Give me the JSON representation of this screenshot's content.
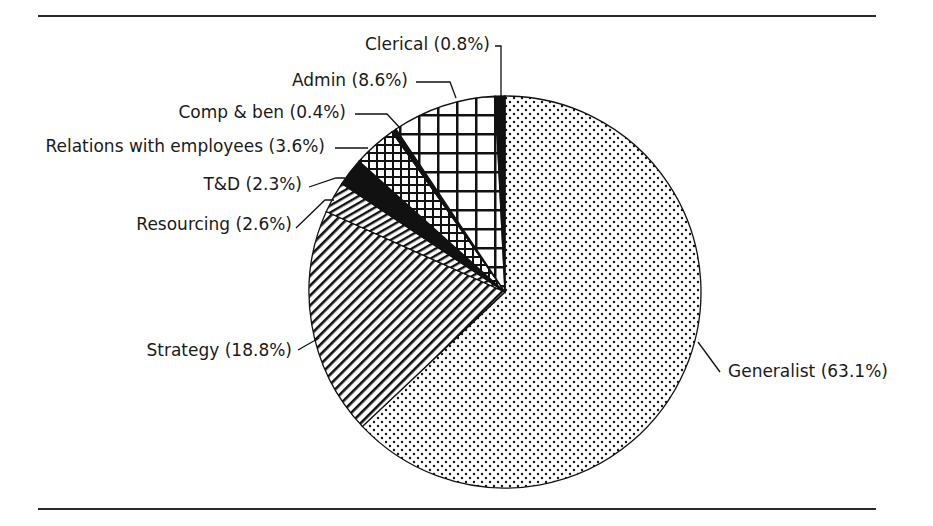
{
  "chart_data": {
    "type": "pie",
    "title": "",
    "start_angle_deg": 0,
    "direction": "clockwise",
    "slices": [
      {
        "label": "Generalist",
        "value": 63.1,
        "display": "Generalist (63.1%)",
        "pattern": "dots"
      },
      {
        "label": "Strategy",
        "value": 18.8,
        "display": "Strategy (18.8%)",
        "pattern": "diagonal-wide"
      },
      {
        "label": "Resourcing",
        "value": 2.6,
        "display": "Resourcing (2.6%)",
        "pattern": "diagonal-shallow"
      },
      {
        "label": "T&D",
        "value": 2.3,
        "display": "T&D (2.3%)",
        "pattern": "solid-black"
      },
      {
        "label": "Relations with employees",
        "value": 3.6,
        "display": "Relations with employees (3.6%)",
        "pattern": "crosshatch-small"
      },
      {
        "label": "Comp & ben",
        "value": 0.4,
        "display": "Comp & ben (0.4%)",
        "pattern": "solid-black"
      },
      {
        "label": "Admin",
        "value": 8.6,
        "display": "Admin (8.6%)",
        "pattern": "grid-large"
      },
      {
        "label": "Clerical",
        "value": 0.8,
        "display": "Clerical (0.8%)",
        "pattern": "solid-black"
      }
    ],
    "legend": "none (leader-line labels)"
  },
  "geometry": {
    "cx": 505,
    "cy": 292,
    "r": 196
  },
  "labels": [
    {
      "key": "chart_data.slices.0.display",
      "x": 728,
      "y": 377,
      "anchor": "start",
      "line": [
        [
          698,
          342
        ],
        [
          720,
          372
        ]
      ]
    },
    {
      "key": "chart_data.slices.1.display",
      "x": 292,
      "y": 356,
      "anchor": "end",
      "line": [
        [
          298,
          350
        ],
        [
          319,
          338
        ]
      ]
    },
    {
      "key": "chart_data.slices.2.display",
      "x": 292,
      "y": 230,
      "anchor": "end",
      "line": [
        [
          296,
          228
        ],
        [
          325,
          200
        ],
        [
          334,
          200
        ]
      ]
    },
    {
      "key": "chart_data.slices.3.display",
      "x": 302,
      "y": 190,
      "anchor": "end",
      "line": [
        [
          309,
          187
        ],
        [
          336,
          178
        ],
        [
          345,
          178
        ]
      ]
    },
    {
      "key": "chart_data.slices.4.display",
      "x": 325,
      "y": 152,
      "anchor": "end",
      "line": [
        [
          335,
          148
        ],
        [
          368,
          148
        ]
      ]
    },
    {
      "key": "chart_data.slices.5.display",
      "x": 346,
      "y": 118,
      "anchor": "end",
      "line": [
        [
          355,
          114
        ],
        [
          387,
          114
        ],
        [
          400,
          128
        ]
      ]
    },
    {
      "key": "chart_data.slices.6.display",
      "x": 408,
      "y": 86,
      "anchor": "end",
      "line": [
        [
          416,
          82
        ],
        [
          450,
          82
        ],
        [
          456,
          98
        ]
      ]
    },
    {
      "key": "chart_data.slices.7.display",
      "x": 490,
      "y": 50,
      "anchor": "end",
      "line": [
        [
          495,
          46
        ],
        [
          501,
          46
        ],
        [
          501,
          97
        ]
      ]
    }
  ]
}
